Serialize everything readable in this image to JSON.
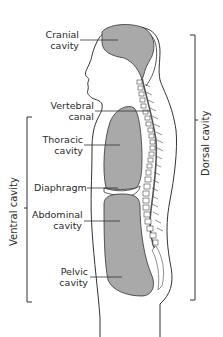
{
  "diagram": {
    "type": "anatomical-sagittal-section",
    "fill_color": "#a9a9a9",
    "outline_color": "#333333",
    "labels": {
      "cranial": [
        "Cranial",
        "cavity"
      ],
      "vertebral": [
        "Vertebral",
        "canal"
      ],
      "thoracic": [
        "Thoracic",
        "cavity"
      ],
      "diaphragm": [
        "Diaphragm"
      ],
      "abdominal": [
        "Abdominal",
        "cavity"
      ],
      "pelvic": [
        "Pelvic",
        "cavity"
      ]
    },
    "brackets": {
      "ventral": "Ventral cavity",
      "dorsal": "Dorsal cavity"
    }
  }
}
